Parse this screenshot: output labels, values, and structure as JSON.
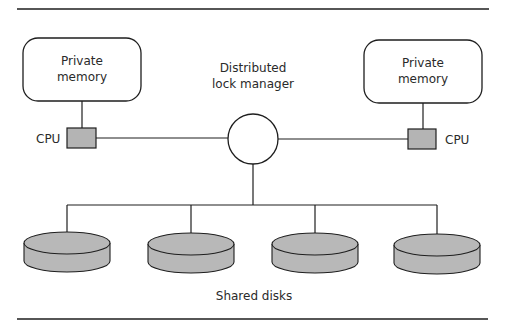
{
  "diagram": {
    "nodes": {
      "left_memory": {
        "label_line1": "Private",
        "label_line2": "memory"
      },
      "right_memory": {
        "label_line1": "Private",
        "label_line2": "memory"
      },
      "left_cpu": {
        "label": "CPU"
      },
      "right_cpu": {
        "label": "CPU"
      },
      "lock_manager": {
        "label_line1": "Distributed",
        "label_line2": "lock manager"
      },
      "disks": [
        {
          "name": "disk-1"
        },
        {
          "name": "disk-2"
        },
        {
          "name": "disk-3"
        },
        {
          "name": "disk-4"
        }
      ],
      "disks_caption": "Shared disks"
    },
    "colors": {
      "line": "#1e1e1e",
      "cpu_fill": "#b4b4b4",
      "disk_fill": "#b8b8b8",
      "background": "#ffffff"
    }
  }
}
